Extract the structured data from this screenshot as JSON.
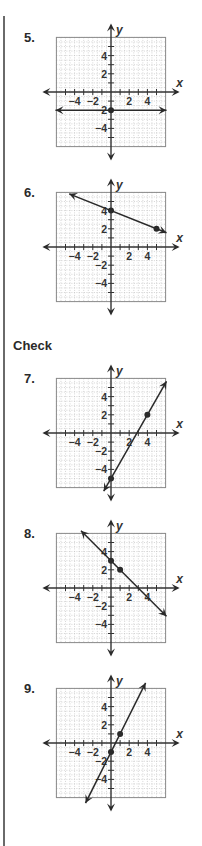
{
  "section_heading": "Check",
  "graph_common": {
    "x_axis_label": "x",
    "y_axis_label": "y",
    "x_tick_labels": [
      "−4",
      "−2",
      "2",
      "4"
    ],
    "y_tick_labels": [
      "4",
      "2",
      "−2",
      "−4"
    ],
    "range": [
      -6,
      6
    ],
    "grid_minor_step": 0.5
  },
  "colors": {
    "line": "#2a2a2a",
    "grid_border": "#8a8a8a",
    "grid_dots": "#b8b8b8",
    "axis": "#333333"
  },
  "problems": [
    {
      "number": "5.",
      "top": 37,
      "line": {
        "type": "horizontal",
        "y": -2
      },
      "points": [
        [
          0,
          -2
        ]
      ]
    },
    {
      "number": "6.",
      "top": 192,
      "line": {
        "slope": -0.4,
        "intercept": 4,
        "x_from": -4.6,
        "x_to": 6.1
      },
      "points": [
        [
          0,
          4
        ],
        [
          5,
          2
        ]
      ]
    },
    {
      "number": "7.",
      "top": 378,
      "line": {
        "slope": 1.75,
        "intercept": -5,
        "x_from": -0.8,
        "x_to": 6.1
      },
      "points": [
        [
          0,
          -5
        ],
        [
          4,
          2
        ]
      ]
    },
    {
      "number": "8.",
      "top": 533,
      "line": {
        "slope": -1,
        "intercept": 3,
        "x_from": -3.3,
        "x_to": 6.1
      },
      "points": [
        [
          0,
          3
        ],
        [
          1,
          2
        ]
      ]
    },
    {
      "number": "9.",
      "top": 688,
      "line": {
        "slope": 2,
        "intercept": -1,
        "x_from": -2.8,
        "x_to": 3.8
      },
      "points": [
        [
          0,
          -1
        ],
        [
          1,
          1
        ]
      ]
    }
  ],
  "chart_data": [
    {
      "type": "line",
      "title": "5.",
      "xlabel": "x",
      "ylabel": "y",
      "xlim": [
        -6,
        6
      ],
      "ylim": [
        -6,
        6
      ],
      "grid": true,
      "x_tick_labels": [
        -4,
        -2,
        2,
        4
      ],
      "y_tick_labels": [
        4,
        2,
        -2,
        -4
      ],
      "series": [
        {
          "name": "y = -2",
          "points": [
            [
              0,
              -2
            ]
          ],
          "equation": "y = -2"
        }
      ]
    },
    {
      "type": "line",
      "title": "6.",
      "xlabel": "x",
      "ylabel": "y",
      "xlim": [
        -6,
        6
      ],
      "ylim": [
        -6,
        6
      ],
      "grid": true,
      "x_tick_labels": [
        -4,
        -2,
        2,
        4
      ],
      "y_tick_labels": [
        4,
        2,
        -2,
        -4
      ],
      "series": [
        {
          "name": "line",
          "points": [
            [
              0,
              4
            ],
            [
              5,
              2
            ]
          ],
          "equation": "y = -2/5 x + 4"
        }
      ]
    },
    {
      "type": "line",
      "title": "7.",
      "xlabel": "x",
      "ylabel": "y",
      "xlim": [
        -6,
        6
      ],
      "ylim": [
        -6,
        6
      ],
      "grid": true,
      "x_tick_labels": [
        -4,
        -2,
        2,
        4
      ],
      "y_tick_labels": [
        4,
        2,
        -2,
        -4
      ],
      "series": [
        {
          "name": "line",
          "points": [
            [
              0,
              -5
            ],
            [
              4,
              2
            ]
          ],
          "equation": "y = 7/4 x - 5"
        }
      ]
    },
    {
      "type": "line",
      "title": "8.",
      "xlabel": "x",
      "ylabel": "y",
      "xlim": [
        -6,
        6
      ],
      "ylim": [
        -6,
        6
      ],
      "grid": true,
      "x_tick_labels": [
        -4,
        -2,
        2,
        4
      ],
      "y_tick_labels": [
        4,
        2,
        -2,
        -4
      ],
      "series": [
        {
          "name": "line",
          "points": [
            [
              0,
              3
            ],
            [
              1,
              2
            ]
          ],
          "equation": "y = -x + 3"
        }
      ]
    },
    {
      "type": "line",
      "title": "9.",
      "xlabel": "x",
      "ylabel": "y",
      "xlim": [
        -6,
        6
      ],
      "ylim": [
        -6,
        6
      ],
      "grid": true,
      "x_tick_labels": [
        -4,
        -2,
        2,
        4
      ],
      "y_tick_labels": [
        4,
        2,
        -2,
        -4
      ],
      "series": [
        {
          "name": "line",
          "points": [
            [
              0,
              -1
            ],
            [
              1,
              1
            ]
          ],
          "equation": "y = 2x - 1"
        }
      ]
    }
  ]
}
